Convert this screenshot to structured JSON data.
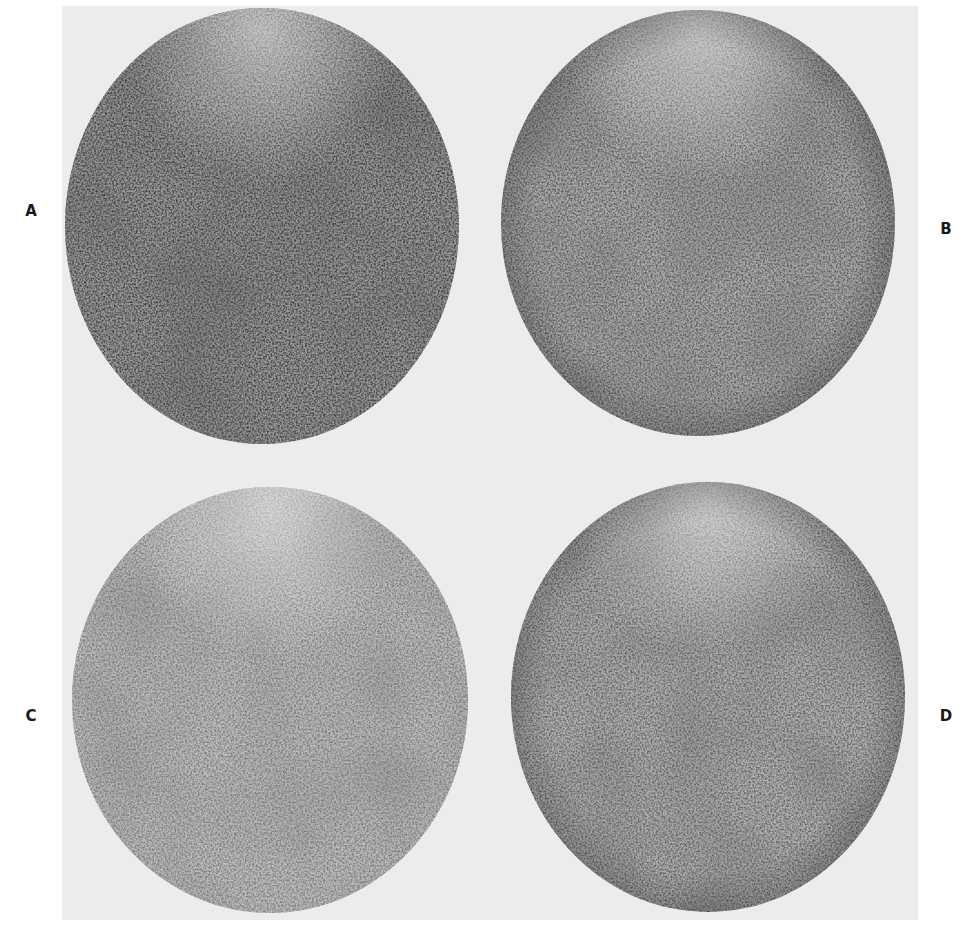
{
  "figure": {
    "background_color": "#ececec",
    "panels": [
      {
        "label": "A",
        "label_x": 31,
        "label_y": 211,
        "cx": 262,
        "cy": 226,
        "rx": 197,
        "ry": 218,
        "tone": "#4a4a4a",
        "density": "darkest"
      },
      {
        "label": "B",
        "label_x": 946,
        "label_y": 229,
        "cx": 698,
        "cy": 223,
        "rx": 197,
        "ry": 213,
        "tone": "#6a6a6a",
        "density": "medium"
      },
      {
        "label": "C",
        "label_x": 31,
        "label_y": 716,
        "cx": 270,
        "cy": 700,
        "rx": 198,
        "ry": 213,
        "tone": "#8a8a8a",
        "density": "lightest"
      },
      {
        "label": "D",
        "label_x": 946,
        "label_y": 716,
        "cx": 708,
        "cy": 697,
        "rx": 197,
        "ry": 215,
        "tone": "#727272",
        "density": "medium"
      }
    ]
  }
}
